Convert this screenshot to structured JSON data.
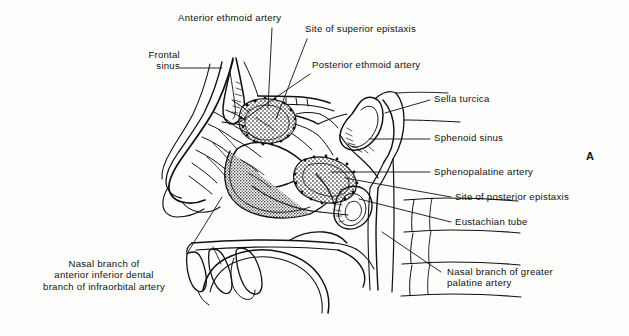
{
  "figure": {
    "panel_letter": "A",
    "title_visible": false,
    "background_color": "#fdfdfc",
    "ink_color": "#111111"
  },
  "labels": [
    {
      "id": "anterior-ethmoid-artery",
      "text": "Anterior ethmoid artery",
      "align": "left",
      "x": 178,
      "y": 12,
      "leader": [
        [
          272,
          28
        ],
        [
          268,
          108
        ]
      ]
    },
    {
      "id": "site-of-superior-epistaxis",
      "text": "Site of superior epistaxis",
      "align": "left",
      "x": 305,
      "y": 23,
      "leader": [
        [
          307,
          39
        ],
        [
          276,
          119
        ]
      ]
    },
    {
      "id": "frontal-sinus",
      "text": "Frontal\nsinus",
      "align": "right",
      "x": 131,
      "y": 49,
      "leader": [
        [
          180,
          68
        ],
        [
          222,
          68
        ]
      ]
    },
    {
      "id": "posterior-ethmoid-artery",
      "text": "Posterior ethmoid artery",
      "align": "left",
      "x": 312,
      "y": 59,
      "leader": [
        [
          310,
          74
        ],
        [
          240,
          122
        ]
      ]
    },
    {
      "id": "sella-turcica",
      "text": "Sella turcica",
      "align": "left",
      "x": 434,
      "y": 93,
      "leader": [
        [
          430,
          100
        ],
        [
          385,
          113
        ]
      ]
    },
    {
      "id": "sphenoid-sinus",
      "text": "Sphenoid sinus",
      "align": "left",
      "x": 434,
      "y": 132,
      "leader": [
        [
          430,
          139
        ],
        [
          369,
          139
        ]
      ]
    },
    {
      "id": "sphenopalatine-artery",
      "text": "Sphenopalatine artery",
      "align": "left",
      "x": 434,
      "y": 166,
      "leader": [
        [
          430,
          172
        ],
        [
          331,
          172
        ]
      ]
    },
    {
      "id": "site-of-posterior-epistaxis",
      "text": "Site of posterior epistaxis",
      "align": "left",
      "x": 455,
      "y": 191,
      "leader": [
        [
          451,
          197
        ],
        [
          345,
          178
        ]
      ]
    },
    {
      "id": "eustachian-tube",
      "text": "Eustachian tube",
      "align": "left",
      "x": 455,
      "y": 216,
      "leader": [
        [
          451,
          222
        ],
        [
          359,
          199
        ]
      ]
    },
    {
      "id": "nasal-branch-of-anterior-inferior-dental-branch-of-infraorbital-artery",
      "text": "Nasal branch of\nanterior inferior dental\nbranch of infraorbital artery",
      "align": "center",
      "x": 41,
      "y": 258,
      "leader": [
        [
          188,
          252
        ],
        [
          222,
          197
        ]
      ]
    },
    {
      "id": "nasal-branch-of-greater-palatine-artery",
      "text": "Nasal branch of greater\npalatine artery",
      "align": "left",
      "x": 447,
      "y": 266,
      "leader": [
        [
          441,
          272
        ],
        [
          382,
          232
        ]
      ]
    }
  ],
  "anatomy_regions": [
    {
      "id": "frontal-sinus-region",
      "name": "frontal sinus"
    },
    {
      "id": "superior-epistaxis-stipple",
      "name": "site of superior epistaxis (stippled)"
    },
    {
      "id": "posterior-epistaxis-stipple",
      "name": "site of posterior epistaxis (stippled)"
    },
    {
      "id": "sella-turcica-region",
      "name": "sella turcica"
    },
    {
      "id": "sphenoid-sinus-region",
      "name": "sphenoid sinus"
    },
    {
      "id": "eustachian-tube-region",
      "name": "eustachian tube"
    },
    {
      "id": "inferior-turbinate-region",
      "name": "inferior turbinate"
    },
    {
      "id": "middle-turbinate-region",
      "name": "middle turbinate"
    },
    {
      "id": "hard-palate-region",
      "name": "hard palate"
    },
    {
      "id": "soft-palate-region",
      "name": "soft palate"
    },
    {
      "id": "tongue-region",
      "name": "tongue"
    },
    {
      "id": "nose-profile",
      "name": "external nose profile"
    }
  ]
}
